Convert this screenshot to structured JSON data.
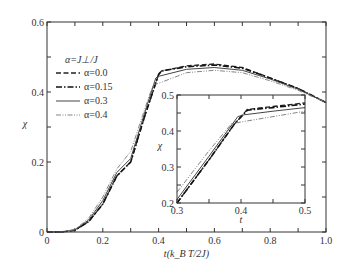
{
  "chart_data": [
    {
      "type": "line",
      "role": "main",
      "title": "",
      "xlabel": "t(k_B T/2J)",
      "ylabel": "χ",
      "xlim": [
        0,
        1.0
      ],
      "ylim": [
        0,
        0.6
      ],
      "xticks": [
        "0",
        "0.2",
        "0.4",
        "0.6",
        "0.8",
        "1.0"
      ],
      "yticks": [
        "0",
        "0.2",
        "0.4",
        "0.6"
      ],
      "grid": false,
      "legend_title": "α=J⊥/J",
      "legend_position": "upper-left",
      "series": [
        {
          "name": "α=0.0",
          "style": "dashed",
          "color": "#222222",
          "x": [
            0.0,
            0.05,
            0.1,
            0.15,
            0.2,
            0.25,
            0.3,
            0.35,
            0.4,
            0.41,
            0.5,
            0.6,
            0.7,
            0.8,
            0.9,
            1.0
          ],
          "y": [
            0.0,
            0.0,
            0.005,
            0.03,
            0.08,
            0.16,
            0.2,
            0.33,
            0.45,
            0.46,
            0.475,
            0.48,
            0.47,
            0.44,
            0.41,
            0.37
          ]
        },
        {
          "name": "α=0.15",
          "style": "dashdot",
          "color": "#111111",
          "x": [
            0.0,
            0.05,
            0.1,
            0.15,
            0.2,
            0.25,
            0.3,
            0.35,
            0.4,
            0.41,
            0.5,
            0.6,
            0.7,
            0.8,
            0.9,
            1.0
          ],
          "y": [
            0.0,
            0.0,
            0.005,
            0.03,
            0.08,
            0.16,
            0.2,
            0.33,
            0.45,
            0.46,
            0.472,
            0.477,
            0.468,
            0.44,
            0.41,
            0.37
          ]
        },
        {
          "name": "α=0.3",
          "style": "solid",
          "color": "#444444",
          "x": [
            0.0,
            0.05,
            0.1,
            0.15,
            0.2,
            0.25,
            0.3,
            0.35,
            0.39,
            0.4,
            0.5,
            0.6,
            0.7,
            0.8,
            0.9,
            1.0
          ],
          "y": [
            0.0,
            0.0,
            0.006,
            0.035,
            0.09,
            0.17,
            0.21,
            0.34,
            0.44,
            0.445,
            0.465,
            0.47,
            0.462,
            0.437,
            0.408,
            0.37
          ]
        },
        {
          "name": "α=0.4",
          "style": "dashdotdot",
          "color": "#777777",
          "x": [
            0.0,
            0.05,
            0.1,
            0.15,
            0.2,
            0.25,
            0.3,
            0.35,
            0.38,
            0.4,
            0.5,
            0.6,
            0.7,
            0.8,
            0.9,
            1.0
          ],
          "y": [
            0.0,
            0.0,
            0.007,
            0.04,
            0.1,
            0.18,
            0.23,
            0.35,
            0.42,
            0.425,
            0.455,
            0.462,
            0.455,
            0.432,
            0.405,
            0.37
          ]
        }
      ]
    },
    {
      "type": "line",
      "role": "inset",
      "title": "",
      "xlabel": "t",
      "ylabel": "χ",
      "xlim": [
        0.3,
        0.5
      ],
      "ylim": [
        0.2,
        0.5
      ],
      "xticks": [
        "0.3",
        "0.4",
        "0.5"
      ],
      "yticks": [
        "0.2",
        "0.3",
        "0.4",
        "0.5"
      ],
      "grid": false,
      "series": [
        {
          "name": "α=0.0",
          "style": "dashed",
          "color": "#222222",
          "x": [
            0.3,
            0.35,
            0.39,
            0.41,
            0.45,
            0.5
          ],
          "y": [
            0.2,
            0.32,
            0.42,
            0.46,
            0.468,
            0.478
          ]
        },
        {
          "name": "α=0.15",
          "style": "dashdot",
          "color": "#111111",
          "x": [
            0.3,
            0.35,
            0.39,
            0.41,
            0.45,
            0.5
          ],
          "y": [
            0.2,
            0.32,
            0.42,
            0.458,
            0.465,
            0.475
          ]
        },
        {
          "name": "α=0.3",
          "style": "solid",
          "color": "#444444",
          "x": [
            0.3,
            0.35,
            0.395,
            0.405,
            0.45,
            0.5
          ],
          "y": [
            0.21,
            0.33,
            0.44,
            0.445,
            0.455,
            0.465
          ]
        },
        {
          "name": "α=0.4",
          "style": "dashdotdot",
          "color": "#777777",
          "x": [
            0.3,
            0.35,
            0.385,
            0.4,
            0.45,
            0.5
          ],
          "y": [
            0.23,
            0.345,
            0.42,
            0.425,
            0.44,
            0.455
          ]
        }
      ]
    }
  ]
}
